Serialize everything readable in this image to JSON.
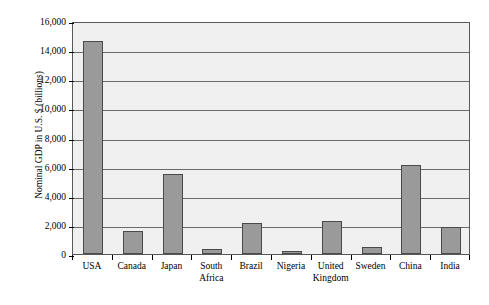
{
  "chart_data": {
    "type": "bar",
    "title": "",
    "xlabel": "",
    "ylabel": "Nominal GDP in U.S. $ (billions)",
    "categories": [
      "USA",
      "Canada",
      "Japan",
      "South Africa",
      "Brazil",
      "Nigeria",
      "United Kingdom",
      "Sweden",
      "China",
      "India"
    ],
    "category_lines": [
      [
        "USA"
      ],
      [
        "Canada"
      ],
      [
        "Japan"
      ],
      [
        "South",
        "Africa"
      ],
      [
        "Brazil"
      ],
      [
        "Nigeria"
      ],
      [
        "United",
        "Kingdom"
      ],
      [
        "Sweden"
      ],
      [
        "China"
      ],
      [
        "India"
      ]
    ],
    "values": [
      14600,
      1600,
      5500,
      360,
      2150,
      200,
      2250,
      460,
      6100,
      1850
    ],
    "ylim": [
      0,
      16000
    ],
    "ytick_values": [
      0,
      2000,
      4000,
      6000,
      8000,
      10000,
      12000,
      14000,
      16000
    ],
    "ytick_labels": [
      "0",
      "2,000",
      "4,000",
      "6,000",
      "8,000",
      "10,000",
      "12,000",
      "14,000",
      "16,000"
    ],
    "grid": true,
    "legend": "none",
    "bar_color": "#9a9a9a",
    "bar_edge_color": "#4a4a4a",
    "plot_background": "#f0f0f0",
    "axis_color": "#585858"
  },
  "watermark": {
    "text": "Nominal GDP by Country"
  }
}
